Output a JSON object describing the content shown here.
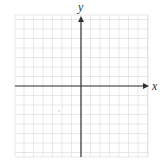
{
  "diagram": {
    "type": "blank-coordinate-grid",
    "x_axis_label": "x",
    "y_axis_label": "y",
    "grid": {
      "left": 15,
      "top": 15,
      "right": 148,
      "bottom": 157,
      "cell_size": 9.5
    },
    "origin": {
      "px_x": 81,
      "px_y": 86
    },
    "colors": {
      "grid_line": "#d8d8d8",
      "axis": "#333333",
      "background": "#ffffff"
    },
    "stray_mark": {
      "px_x": 59,
      "px_y": 111
    }
  }
}
